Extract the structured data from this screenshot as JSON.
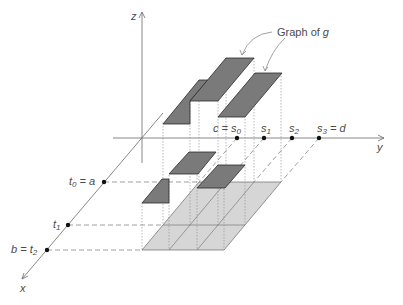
{
  "figure": {
    "title_label": {
      "text": "Graph of ",
      "var": "g"
    },
    "axes": {
      "x": {
        "label": "x"
      },
      "y": {
        "label": "y"
      },
      "z": {
        "label": "z"
      }
    },
    "y_partition": [
      {
        "pre": "c = s",
        "sub": "0",
        "post": ""
      },
      {
        "pre": "s",
        "sub": "1",
        "post": ""
      },
      {
        "pre": "s",
        "sub": "2",
        "post": ""
      },
      {
        "pre": "s",
        "sub": "3",
        "post": " = d"
      }
    ],
    "x_partition": [
      {
        "pre": "t",
        "sub": "0",
        "post": " = a"
      },
      {
        "pre": "t",
        "sub": "1",
        "post": ""
      },
      {
        "pre": "b = t",
        "sub": "2",
        "post": ""
      }
    ],
    "step_function": {
      "description": "Step function g constant on each subrectangle [t_{i-1},t_i] x [s_{j-1},s_j]",
      "relative_heights": [
        {
          "t_interval": "[t0,t1]",
          "s_interval": "[s0,s1]",
          "height": 102
        },
        {
          "t_interval": "[t0,t1]",
          "s_interval": "[s1,s2]",
          "height": 124
        },
        {
          "t_interval": "[t0,t1]",
          "s_interval": "[s2,s3]",
          "height": 109
        },
        {
          "t_interval": "[t1,t2]",
          "s_interval": "[s0,s1]",
          "height": 47
        },
        {
          "t_interval": "[t1,t2]",
          "s_interval": "[s1,s2]",
          "height": 75
        },
        {
          "t_interval": "[t1,t2]",
          "s_interval": "[s2,s3]",
          "height": 61
        }
      ]
    },
    "colors": {
      "step_tops": "#7a7a7a",
      "base_rectangle": "#d6d6d6",
      "lines": "#6a6a6a",
      "points": "#111111"
    }
  }
}
